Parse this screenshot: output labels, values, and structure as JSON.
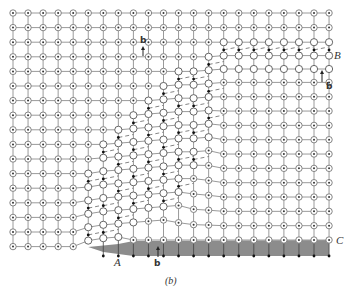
{
  "figure": {
    "caption": "(b)",
    "labels": {
      "A": "A",
      "B": "B",
      "C": "C",
      "burgers_top": "b",
      "burgers_right": "b",
      "burgers_bottom": "b"
    },
    "colors": {
      "grid_line": "#9a9a9a",
      "atom_ring": "#777777",
      "atom_dot": "#333333",
      "open_atom": "#555555",
      "black_dot": "#111111",
      "shaded_region": "#8c8c8c",
      "label": "#333333"
    },
    "lattice": {
      "columns": 22,
      "rows": 17,
      "x0": 13,
      "dx": 15.05,
      "y0": 13,
      "dy": 14.6
    }
  }
}
